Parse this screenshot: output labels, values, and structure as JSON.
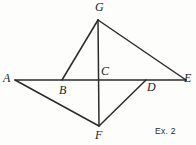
{
  "figure": {
    "caption": "Ex. 2",
    "stroke_color": "#2b2b2b",
    "background_color": "#fdfdfb",
    "label_color": "#1c1c1c",
    "points": {
      "A": {
        "label": "A",
        "x": 15,
        "y": 80
      },
      "B": {
        "label": "B",
        "x": 62,
        "y": 80
      },
      "C": {
        "label": "C",
        "x": 99,
        "y": 80
      },
      "D": {
        "label": "D",
        "x": 146,
        "y": 80
      },
      "E": {
        "label": "E",
        "x": 186,
        "y": 80
      },
      "F": {
        "label": "F",
        "x": 99,
        "y": 126
      },
      "G": {
        "label": "G",
        "x": 98,
        "y": 20
      }
    },
    "segments": [
      {
        "name": "A-E",
        "from": "A",
        "to": "E"
      },
      {
        "name": "G-F",
        "from": "G",
        "to": "F"
      },
      {
        "name": "G-B",
        "from": "G",
        "to": "B"
      },
      {
        "name": "G-E",
        "from": "G",
        "to": "E"
      },
      {
        "name": "A-F",
        "from": "A",
        "to": "F"
      },
      {
        "name": "F-D",
        "from": "F",
        "to": "D"
      }
    ]
  }
}
